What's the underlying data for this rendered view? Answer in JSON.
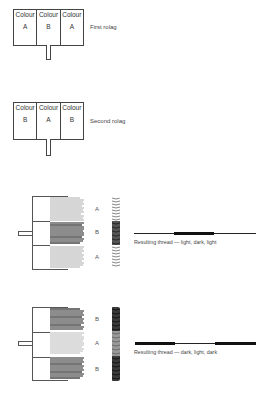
{
  "rolags": [
    {
      "label": "First rolag",
      "cells": [
        {
          "heading": "Colour",
          "letter": "A"
        },
        {
          "heading": "Colour",
          "letter": "B"
        },
        {
          "heading": "Colour",
          "letter": "A"
        }
      ]
    },
    {
      "label": "Second rolag",
      "cells": [
        {
          "heading": "Colour",
          "letter": "B"
        },
        {
          "heading": "Colour",
          "letter": "A"
        },
        {
          "heading": "Colour",
          "letter": "B"
        }
      ]
    }
  ],
  "spindles": [
    {
      "sections": [
        "A",
        "B",
        "A"
      ],
      "shades": [
        "light",
        "dark",
        "light"
      ],
      "caption": "Resulting thread — light, dark, light"
    },
    {
      "sections": [
        "B",
        "A",
        "B"
      ],
      "shades": [
        "dark",
        "light",
        "dark"
      ],
      "caption": "Resulting thread — dark, light, dark"
    }
  ],
  "colors": {
    "light_stripe": "#a8a8a8",
    "dark_stripe": "#1a1a1a",
    "line": "#444444"
  }
}
